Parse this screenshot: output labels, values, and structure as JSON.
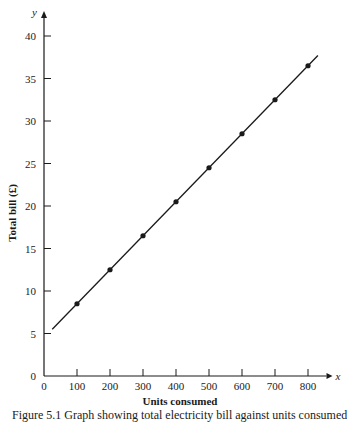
{
  "chart_data": {
    "type": "line",
    "title": "",
    "xlabel": "Units consumed",
    "ylabel": "Total bill (£)",
    "x_axis_var": "x",
    "y_axis_var": "y",
    "xlim": [
      0,
      850
    ],
    "ylim": [
      0,
      42
    ],
    "x_ticks": [
      0,
      100,
      200,
      300,
      400,
      500,
      600,
      700,
      800
    ],
    "y_ticks": [
      0,
      5,
      10,
      15,
      20,
      25,
      30,
      35,
      40
    ],
    "grid": false,
    "legend": null,
    "series": [
      {
        "name": "Total bill",
        "style": "line with markers",
        "x": [
          100,
          200,
          300,
          400,
          500,
          600,
          700,
          800
        ],
        "y": [
          8.5,
          12.5,
          16.5,
          20.5,
          24.5,
          28.5,
          32.5,
          36.5
        ]
      }
    ],
    "fitted_line": {
      "x_start": 25,
      "y_start": 5.5,
      "x_end": 830,
      "y_end": 37.7,
      "slope": 0.04,
      "intercept": 4.5
    }
  },
  "caption": "Figure 5.1   Graph showing total electricity bill against units consumed"
}
